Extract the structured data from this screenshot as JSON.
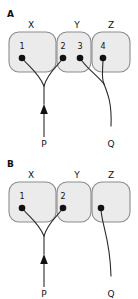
{
  "figure": {
    "background_color": "#ffffff",
    "box_fill_color": "#ebebeb",
    "box_stroke_color": "#8c8c8c",
    "line_color": "#2b2b2b",
    "dot_color": "#111111"
  },
  "panels": [
    {
      "letter": "A",
      "compartments": [
        {
          "label": "X"
        },
        {
          "label": "Y"
        },
        {
          "label": "Z"
        }
      ],
      "nodes": [
        {
          "number": "1"
        },
        {
          "number": "2"
        },
        {
          "number": "3"
        },
        {
          "number": "4"
        }
      ],
      "endpoints": [
        {
          "label": "P"
        },
        {
          "label": "Q"
        }
      ]
    },
    {
      "letter": "B",
      "compartments": [
        {
          "label": "X"
        },
        {
          "label": "Y"
        },
        {
          "label": "Z"
        }
      ],
      "nodes": [
        {
          "number": "1"
        },
        {
          "number": "2"
        },
        {
          "number": ""
        }
      ],
      "endpoints": [
        {
          "label": "P"
        },
        {
          "label": "Q"
        }
      ]
    }
  ]
}
